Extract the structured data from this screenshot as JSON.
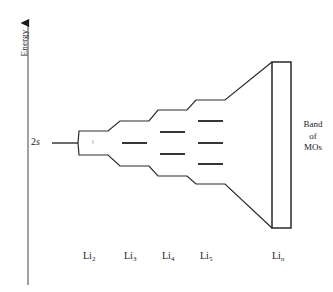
{
  "axis": {
    "title": "Energy",
    "direction": "up",
    "x": 28,
    "y_top": 15,
    "y_bottom": 285
  },
  "starting_level": {
    "label_prefix": "2",
    "label_italic": "s",
    "y": 143,
    "x_start": 52,
    "x_end": 78
  },
  "band": {
    "caption_lines": [
      "Band",
      "of",
      "MOs"
    ],
    "box": {
      "x": 272,
      "y": 62,
      "width": 19,
      "height": 166
    }
  },
  "colors": {
    "line": "#1a1a1a",
    "level": "#2b2b2b",
    "background": "#ffffff",
    "text": "#1a1a1a"
  },
  "chart_data": {
    "type": "diagram",
    "ylabel": "Energy",
    "columns": [
      {
        "label_base": "Li",
        "label_sub": "2",
        "label_sub_italic": false,
        "n_levels": 2,
        "x_center": 93,
        "x_start": 79,
        "x_end": 108,
        "label_x": 83,
        "label_y": 257,
        "levels_y": [
          131,
          155
        ]
      },
      {
        "label_base": "Li",
        "label_sub": "3",
        "label_sub_italic": false,
        "n_levels": 3,
        "x_center": 134,
        "x_start": 120,
        "x_end": 149,
        "label_x": 124,
        "label_y": 257,
        "levels_y": [
          121,
          143,
          166
        ]
      },
      {
        "label_base": "Li",
        "label_sub": "4",
        "label_sub_italic": false,
        "n_levels": 4,
        "x_center": 172,
        "x_start": 158,
        "x_end": 187,
        "label_x": 162,
        "label_y": 257,
        "levels_y": [
          110,
          132,
          154,
          176
        ]
      },
      {
        "label_base": "Li",
        "label_sub": "5",
        "label_sub_italic": false,
        "n_levels": 5,
        "x_center": 210,
        "x_start": 196,
        "x_end": 225,
        "label_x": 200,
        "label_y": 257,
        "levels_y": [
          100,
          121,
          143,
          164,
          184
        ]
      },
      {
        "label_base": "Li",
        "label_sub": "n",
        "label_sub_italic": true,
        "n_levels": "continuum",
        "x_center": 281,
        "x_start": 272,
        "x_end": 291,
        "label_x": 272,
        "label_y": 257,
        "levels_y": []
      }
    ],
    "upper_envelope": [
      [
        78,
        143
      ],
      [
        79,
        131
      ],
      [
        108,
        131
      ],
      [
        120,
        121
      ],
      [
        149,
        121
      ],
      [
        158,
        110
      ],
      [
        187,
        110
      ],
      [
        196,
        100
      ],
      [
        225,
        100
      ],
      [
        272,
        62
      ]
    ],
    "lower_envelope": [
      [
        78,
        143
      ],
      [
        79,
        155
      ],
      [
        108,
        155
      ],
      [
        120,
        166
      ],
      [
        149,
        166
      ],
      [
        158,
        176
      ],
      [
        187,
        176
      ],
      [
        196,
        184
      ],
      [
        225,
        184
      ],
      [
        272,
        228
      ]
    ]
  }
}
